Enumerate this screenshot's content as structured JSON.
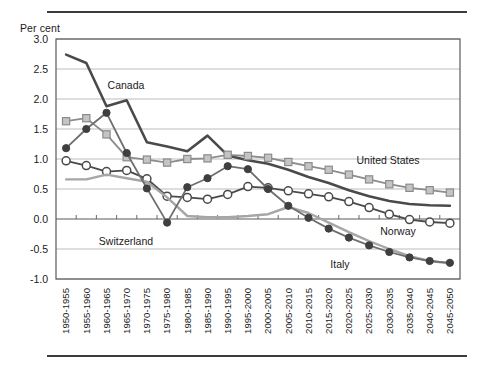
{
  "header": {
    "rule_top": "",
    "rule_bottom": ""
  },
  "axis": {
    "ylabel": "Per cent",
    "yticks": [
      "3.0",
      "2.5",
      "2.0",
      "1.5",
      "1.0",
      "0.5",
      "0.0",
      "-0.5",
      "-1.0"
    ]
  },
  "chart_data": {
    "type": "line",
    "title": "",
    "xlabel": "",
    "ylabel": "Per cent",
    "ylim": [
      -1.0,
      3.0
    ],
    "ytick_values": [
      3.0,
      2.5,
      2.0,
      1.5,
      1.0,
      0.5,
      0.0,
      -0.5,
      -1.0
    ],
    "grid": true,
    "legend": "inline-annotations",
    "categories": [
      "1950-1955",
      "1955-1960",
      "1960-1965",
      "1965-1970",
      "1970-1975",
      "1975-1980",
      "1980-1985",
      "1985-1990",
      "1990-1995",
      "1995-2000",
      "2000-2005",
      "2005-2010",
      "2010-2015",
      "2015-2020",
      "2020-2025",
      "2025-2030",
      "2030-2035",
      "2035-2040",
      "2040-2045",
      "2045-2050"
    ],
    "series": [
      {
        "name": "Canada",
        "color": "#4a4a4a",
        "marker": "none",
        "width": 2.6,
        "label_x": 126,
        "label_y": 89,
        "values": [
          2.74,
          2.6,
          1.88,
          1.98,
          1.28,
          1.21,
          1.13,
          1.39,
          1.06,
          0.98,
          0.92,
          0.82,
          0.7,
          0.6,
          0.48,
          0.38,
          0.3,
          0.25,
          0.23,
          0.22
        ]
      },
      {
        "name": "United States",
        "color": "#8c8c8c",
        "marker": "square",
        "width": 1.8,
        "label_x": 388,
        "label_y": 164,
        "values": [
          1.63,
          1.68,
          1.41,
          1.03,
          0.99,
          0.94,
          1.0,
          1.01,
          1.07,
          1.05,
          1.02,
          0.95,
          0.88,
          0.82,
          0.74,
          0.66,
          0.58,
          0.52,
          0.48,
          0.44
        ]
      },
      {
        "name": "Norway",
        "color": "#4a4a4a",
        "marker": "circle-open",
        "width": 1.8,
        "label_x": 398,
        "label_y": 235,
        "values": [
          0.97,
          0.89,
          0.79,
          0.81,
          0.67,
          0.38,
          0.36,
          0.33,
          0.41,
          0.54,
          0.52,
          0.47,
          0.42,
          0.37,
          0.29,
          0.19,
          0.08,
          -0.01,
          -0.05,
          -0.07
        ]
      },
      {
        "name": "Italy",
        "color": "#a6a6a6",
        "marker": "none",
        "width": 2.4,
        "label_x": 340,
        "label_y": 268,
        "values": [
          0.66,
          0.66,
          0.74,
          0.68,
          0.62,
          0.36,
          0.05,
          0.03,
          0.03,
          0.05,
          0.08,
          0.2,
          0.1,
          -0.06,
          -0.22,
          -0.37,
          -0.5,
          -0.62,
          -0.7,
          -0.74
        ]
      },
      {
        "name": "Switzerland",
        "color": "#6e6e6e",
        "marker": "circle-filled",
        "width": 1.8,
        "label_x": 126,
        "label_y": 245,
        "values": [
          1.18,
          1.5,
          1.77,
          1.1,
          0.51,
          -0.06,
          0.53,
          0.68,
          0.88,
          0.83,
          0.5,
          0.22,
          0.02,
          -0.16,
          -0.31,
          -0.44,
          -0.55,
          -0.64,
          -0.7,
          -0.73
        ]
      }
    ]
  }
}
